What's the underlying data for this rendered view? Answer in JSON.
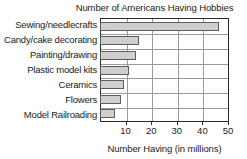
{
  "chart_data": {
    "type": "bar",
    "orientation": "horizontal",
    "title": "Number of Americans Having Hobbies",
    "xlabel": "Number Having (in millions)",
    "ylabel": "",
    "categories": [
      "Sewing/needlecrafts",
      "Candy/cake decorating",
      "Painting/drawing",
      "Plastic model kits",
      "Ceramics",
      "Flowers",
      "Model Railroading"
    ],
    "values": [
      46,
      14.7,
      13.5,
      11,
      9,
      8,
      5.5
    ],
    "xlim": [
      0,
      50
    ],
    "xticks": [
      10,
      20,
      30,
      40,
      50
    ],
    "xtick_labels": [
      "10",
      "20",
      "30",
      "40",
      "50"
    ],
    "grid": "both",
    "legend": "none",
    "bar_fill_color": "#cfcfcf",
    "bar_border_color": "#5d5d5d",
    "axis_color": "#2b2b2b",
    "grid_color": "#9a9a9a",
    "background_color": "#ffffff"
  }
}
